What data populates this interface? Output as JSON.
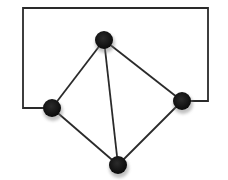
{
  "diagram": {
    "type": "graph",
    "width": 228,
    "height": 180,
    "colors": {
      "edge": "#2a2a2a",
      "node": "#111111",
      "background": "#ffffff"
    },
    "node_radius": 9,
    "nodes": [
      {
        "id": "top",
        "x": 104,
        "y": 40
      },
      {
        "id": "left",
        "x": 52,
        "y": 108
      },
      {
        "id": "right",
        "x": 182,
        "y": 101
      },
      {
        "id": "bottom",
        "x": 118,
        "y": 165
      }
    ],
    "edges": [
      {
        "from": "top",
        "to": "left"
      },
      {
        "from": "top",
        "to": "right"
      },
      {
        "from": "top",
        "to": "bottom"
      },
      {
        "from": "left",
        "to": "bottom"
      },
      {
        "from": "right",
        "to": "bottom"
      }
    ],
    "loop_edge": {
      "from": "left",
      "to": "right",
      "points": [
        [
          52,
          108
        ],
        [
          23,
          108
        ],
        [
          23,
          8
        ],
        [
          208,
          8
        ],
        [
          208,
          101
        ],
        [
          182,
          101
        ]
      ]
    }
  }
}
